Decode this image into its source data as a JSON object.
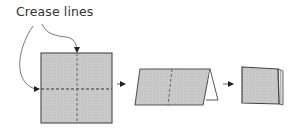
{
  "diagram": {
    "label": "Crease lines",
    "steps": [
      {
        "name": "flat-square-with-creases",
        "description": "Square sheet with one horizontal and one vertical dashed crease line"
      },
      {
        "name": "folded-in-half",
        "description": "Sheet folded along horizontal crease, shown as tent shape"
      },
      {
        "name": "folded-in-quarters",
        "description": "Sheet folded again into small square"
      }
    ],
    "colors": {
      "paper_fill": "#c8c8c8",
      "outline": "#555555",
      "crease": "#444444",
      "arrow": "#333333",
      "text": "#333333"
    }
  }
}
